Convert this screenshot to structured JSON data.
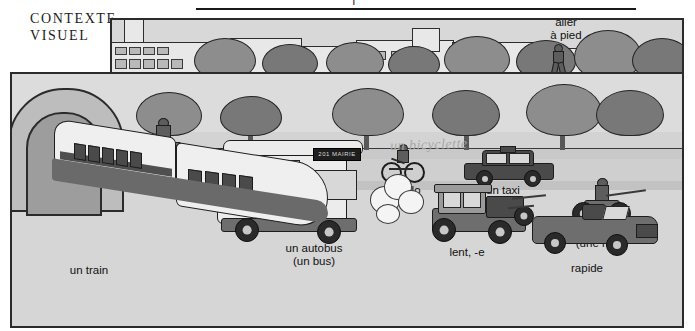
{
  "header": {
    "cut_text": "l",
    "rule": true
  },
  "caption": {
    "line1": "CONTEXTE",
    "line2": "VISUEL"
  },
  "scene": {
    "title": "street scene with modes of transportation",
    "background_color": "#d3d3d3",
    "frame_color": "#2b2b2b"
  },
  "labels": {
    "voiture": "une voiture",
    "velo": "un vélo",
    "taxi": "un taxi",
    "aller_a_pied": "aller\nà pied",
    "mobylette": "une mobylette\n(une mob)",
    "moto": "une moto",
    "autobus": "un autobus\n(un bus)",
    "lent": "lent, -e",
    "rapide": "rapide",
    "train": "un train"
  },
  "handwritten": {
    "bicyclette": "un bicyclette"
  },
  "bus": {
    "destination_sign": "201 MAIRIE"
  },
  "vocabulary_items": [
    {
      "term": "une voiture",
      "gloss": "a car"
    },
    {
      "term": "un vélo",
      "gloss": "a bicycle"
    },
    {
      "term": "un taxi",
      "gloss": "a taxi"
    },
    {
      "term": "aller à pied",
      "gloss": "to go on foot"
    },
    {
      "term": "une mobylette",
      "gloss": "a moped"
    },
    {
      "term": "une moto",
      "gloss": "a motorcycle"
    },
    {
      "term": "un autobus",
      "gloss": "a bus"
    },
    {
      "term": "un train",
      "gloss": "a train"
    },
    {
      "term": "lent, -e",
      "gloss": "slow"
    },
    {
      "term": "rapide",
      "gloss": "fast"
    }
  ],
  "colors": {
    "ink": "#1a1a1a",
    "scene_bg": "#d3d3d3",
    "sky": "#dcdcdc",
    "road": "#cfcfcf",
    "foliage": "#8d8d8d",
    "handwriting": "#a8a8a8"
  }
}
